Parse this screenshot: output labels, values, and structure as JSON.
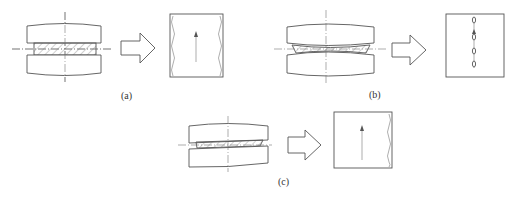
{
  "figure": {
    "panels": [
      {
        "id": "a",
        "label": "(a)",
        "left_drawing": "flat-anvils-parallel-compression",
        "workpiece_shape": "rectangular-hatched-slab",
        "transform_arrow": "hollow-right-arrow",
        "result": "rectangle-with-wavy-left-and-right-edges-and-upward-arrow"
      },
      {
        "id": "b",
        "label": "(b)",
        "left_drawing": "convex-anvils-compression",
        "workpiece_shape": "thin-lens-hatched-slab",
        "transform_arrow": "hollow-right-arrow",
        "result": "rectangle-with-central-chain-of-ovals-and-upward-arrow"
      },
      {
        "id": "c",
        "label": "(c)",
        "left_drawing": "tilted-anvils-compression",
        "workpiece_shape": "wedge-hatched-slab",
        "transform_arrow": "hollow-right-arrow",
        "result": "rectangle-with-wavy-right-edge-and-upward-arrow"
      }
    ]
  },
  "colors": {
    "line": "#555555",
    "background": "#ffffff",
    "text": "#333333"
  }
}
